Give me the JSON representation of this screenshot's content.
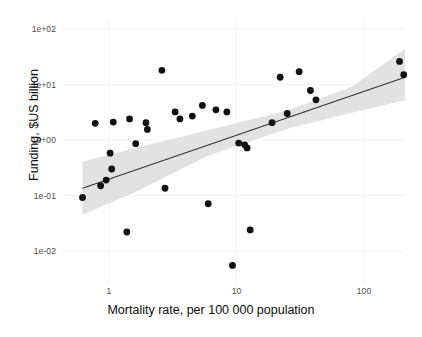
{
  "chart_data": {
    "type": "scatter",
    "title": "",
    "xlabel": "Mortality rate, per 100 000 population",
    "ylabel": "Funding, $US billion",
    "xscale": "log",
    "yscale": "log",
    "xlim": [
      0.55,
      260
    ],
    "ylim": [
      0.0045,
      170
    ],
    "grid": true,
    "grid_color": "#f2f2f2",
    "legend": "none",
    "xticks": [
      {
        "value": 1,
        "label": "1"
      },
      {
        "value": 10,
        "label": "10"
      },
      {
        "value": 100,
        "label": "100"
      }
    ],
    "yticks": [
      {
        "value": 100,
        "label": "1e+02"
      },
      {
        "value": 10,
        "label": "1e+01"
      },
      {
        "value": 1,
        "label": "1e+00"
      },
      {
        "value": 0.1,
        "label": "1e-01"
      },
      {
        "value": 0.01,
        "label": "1e-02"
      }
    ],
    "point_color": "#111111",
    "point_radius_px": 3.4,
    "points": [
      {
        "x": 0.62,
        "y": 0.092
      },
      {
        "x": 0.86,
        "y": 0.15
      },
      {
        "x": 0.95,
        "y": 0.19
      },
      {
        "x": 0.78,
        "y": 2.0
      },
      {
        "x": 1.02,
        "y": 0.58
      },
      {
        "x": 1.05,
        "y": 0.3
      },
      {
        "x": 1.08,
        "y": 2.1
      },
      {
        "x": 1.38,
        "y": 0.022
      },
      {
        "x": 1.45,
        "y": 2.4
      },
      {
        "x": 1.62,
        "y": 0.86
      },
      {
        "x": 1.95,
        "y": 2.05
      },
      {
        "x": 2.0,
        "y": 1.55
      },
      {
        "x": 2.6,
        "y": 18.0
      },
      {
        "x": 2.75,
        "y": 0.135
      },
      {
        "x": 3.3,
        "y": 3.2
      },
      {
        "x": 3.6,
        "y": 2.4
      },
      {
        "x": 4.5,
        "y": 2.7
      },
      {
        "x": 5.4,
        "y": 4.2
      },
      {
        "x": 6.0,
        "y": 0.071
      },
      {
        "x": 6.9,
        "y": 3.5
      },
      {
        "x": 8.4,
        "y": 3.2
      },
      {
        "x": 9.3,
        "y": 0.0055
      },
      {
        "x": 10.4,
        "y": 0.88
      },
      {
        "x": 11.6,
        "y": 0.82
      },
      {
        "x": 12.1,
        "y": 0.72
      },
      {
        "x": 12.8,
        "y": 0.024
      },
      {
        "x": 19.0,
        "y": 2.05
      },
      {
        "x": 22.0,
        "y": 13.5
      },
      {
        "x": 25.0,
        "y": 3.0
      },
      {
        "x": 31.0,
        "y": 17.0
      },
      {
        "x": 38.0,
        "y": 7.8
      },
      {
        "x": 42.0,
        "y": 5.3
      },
      {
        "x": 190.0,
        "y": 26.0
      },
      {
        "x": 205.0,
        "y": 15.0
      }
    ],
    "fit_line": {
      "color": "#333333",
      "width_px": 1.1,
      "x_start": 0.62,
      "y_start": 0.135,
      "x_end": 210,
      "y_end": 13.5
    },
    "confidence_band": {
      "color": "#e2e2e2",
      "opacity": 1,
      "upper": [
        {
          "x": 0.62,
          "y": 0.41
        },
        {
          "x": 1.6,
          "y": 0.72
        },
        {
          "x": 6.0,
          "y": 1.5
        },
        {
          "x": 25.0,
          "y": 3.4
        },
        {
          "x": 80.0,
          "y": 9.0
        },
        {
          "x": 210,
          "y": 44.0
        }
      ],
      "lower": [
        {
          "x": 0.62,
          "y": 0.045
        },
        {
          "x": 1.6,
          "y": 0.115
        },
        {
          "x": 6.0,
          "y": 0.52
        },
        {
          "x": 25.0,
          "y": 1.6
        },
        {
          "x": 80.0,
          "y": 3.1
        },
        {
          "x": 210,
          "y": 5.2
        }
      ]
    }
  }
}
